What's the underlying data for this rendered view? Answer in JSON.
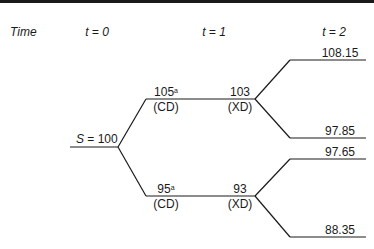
{
  "header": {
    "time_label": "Time",
    "t0": "t = 0",
    "t1": "t = 1",
    "t2": "t = 2"
  },
  "root": {
    "label": "S = 100"
  },
  "t1_nodes": {
    "up": {
      "cd_value": "105",
      "cd_note": "a",
      "cd_label": "(CD)",
      "xd_value": "103",
      "xd_label": "(XD)"
    },
    "down": {
      "cd_value": "95",
      "cd_note": "a",
      "cd_label": "(CD)",
      "xd_value": "93",
      "xd_label": "(XD)"
    }
  },
  "t2_nodes": {
    "uu": "108.15",
    "ud": "97.85",
    "du": "97.65",
    "dd": "88.35"
  }
}
